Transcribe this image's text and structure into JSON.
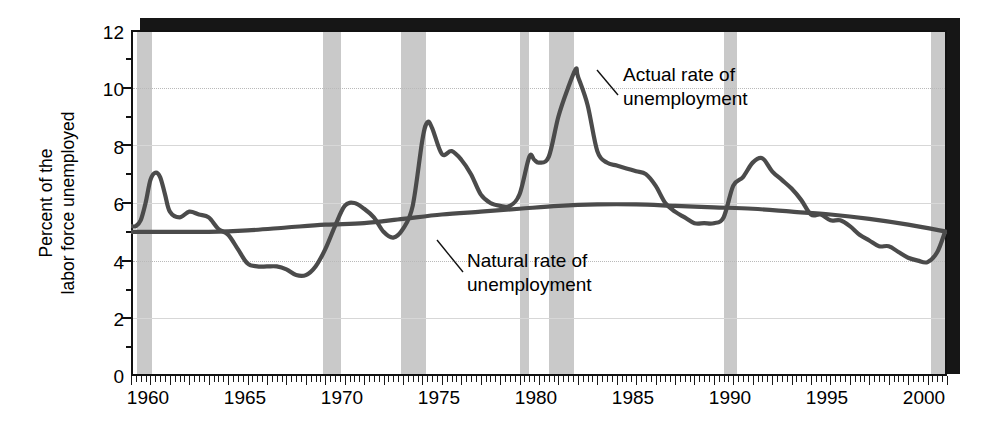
{
  "chart_data": {
    "type": "line",
    "title": "",
    "xlabel": "",
    "ylabel": "Percent of the labor force unemployed",
    "ylabel_line1": "Percent of the",
    "ylabel_line2": "labor force unemployed",
    "xlim": [
      1960,
      2002
    ],
    "ylim": [
      0,
      12
    ],
    "ytick_labels": [
      "0",
      "2",
      "4",
      "6",
      "8",
      "10",
      "12"
    ],
    "ytick_values": [
      0,
      2,
      4,
      6,
      8,
      10,
      12
    ],
    "xtick_labels": [
      "1960",
      "1965",
      "1970",
      "1975",
      "1980",
      "1985",
      "1990",
      "1995",
      "2000"
    ],
    "xtick_values": [
      1960,
      1965,
      1970,
      1975,
      1980,
      1985,
      1990,
      1995,
      2000
    ],
    "grid": "horizontal",
    "legend": "annotations",
    "line_color": "#4b4b4b",
    "recession_color": "#c9c9c9",
    "annotations": [
      {
        "name": "actual-rate-annotation",
        "line1": "Actual rate of",
        "line2": "unemployment"
      },
      {
        "name": "natural-rate-annotation",
        "line1": "Natural rate of",
        "line2": "unemployment"
      }
    ],
    "recessions": [
      {
        "start": 1960.3,
        "end": 1961.1
      },
      {
        "start": 1969.9,
        "end": 1970.8
      },
      {
        "start": 1973.9,
        "end": 1975.2
      },
      {
        "start": 1980.0,
        "end": 1980.5
      },
      {
        "start": 1981.5,
        "end": 1982.8
      },
      {
        "start": 1990.5,
        "end": 1991.2
      },
      {
        "start": 2001.2,
        "end": 2002.0
      }
    ],
    "series": [
      {
        "name": "Actual rate of unemployment",
        "x": [
          1960.0,
          1960.25,
          1960.5,
          1960.75,
          1961.0,
          1961.25,
          1961.5,
          1961.75,
          1962.0,
          1962.5,
          1963.0,
          1963.5,
          1964.0,
          1964.5,
          1965.0,
          1965.5,
          1966.0,
          1966.5,
          1967.0,
          1967.5,
          1968.0,
          1968.5,
          1969.0,
          1969.5,
          1970.0,
          1970.5,
          1971.0,
          1971.5,
          1972.0,
          1972.5,
          1973.0,
          1973.5,
          1974.0,
          1974.5,
          1975.0,
          1975.25,
          1975.5,
          1976.0,
          1976.5,
          1977.0,
          1977.5,
          1978.0,
          1978.5,
          1979.0,
          1979.5,
          1980.0,
          1980.5,
          1980.75,
          1981.0,
          1981.5,
          1982.0,
          1982.5,
          1982.9,
          1983.0,
          1983.5,
          1984.0,
          1984.5,
          1985.0,
          1985.5,
          1986.0,
          1986.5,
          1987.0,
          1987.5,
          1988.0,
          1988.5,
          1989.0,
          1989.5,
          1990.0,
          1990.5,
          1991.0,
          1991.5,
          1992.0,
          1992.5,
          1993.0,
          1993.5,
          1994.0,
          1994.5,
          1995.0,
          1995.5,
          1996.0,
          1996.5,
          1997.0,
          1997.5,
          1998.0,
          1998.5,
          1999.0,
          1999.5,
          2000.0,
          2000.5,
          2001.0,
          2001.5,
          2001.9
        ],
        "y": [
          5.2,
          5.2,
          5.4,
          6.0,
          6.8,
          7.05,
          6.9,
          6.3,
          5.7,
          5.5,
          5.7,
          5.6,
          5.5,
          5.1,
          4.9,
          4.4,
          3.9,
          3.8,
          3.8,
          3.8,
          3.7,
          3.5,
          3.5,
          3.8,
          4.4,
          5.2,
          5.9,
          6.0,
          5.8,
          5.5,
          5.0,
          4.8,
          5.1,
          5.9,
          8.2,
          8.8,
          8.6,
          7.7,
          7.8,
          7.5,
          7.0,
          6.3,
          6.0,
          5.9,
          5.9,
          6.3,
          7.6,
          7.5,
          7.4,
          7.6,
          9.0,
          10.0,
          10.65,
          10.4,
          9.4,
          7.8,
          7.4,
          7.3,
          7.2,
          7.1,
          7.0,
          6.6,
          6.0,
          5.7,
          5.5,
          5.3,
          5.3,
          5.3,
          5.5,
          6.6,
          6.9,
          7.4,
          7.55,
          7.1,
          6.8,
          6.5,
          6.1,
          5.6,
          5.6,
          5.4,
          5.4,
          5.2,
          4.9,
          4.7,
          4.5,
          4.5,
          4.3,
          4.1,
          4.0,
          3.95,
          4.3,
          5.0
        ]
      },
      {
        "name": "Natural rate of unemployment",
        "x": [
          1960,
          1962,
          1964,
          1966,
          1968,
          1970,
          1972,
          1974,
          1976,
          1978,
          1980,
          1982,
          1984,
          1986,
          1988,
          1990,
          1992,
          1994,
          1996,
          1998,
          2000,
          2002
        ],
        "y": [
          5.0,
          5.0,
          5.0,
          5.05,
          5.15,
          5.25,
          5.3,
          5.45,
          5.6,
          5.7,
          5.8,
          5.9,
          5.95,
          5.95,
          5.9,
          5.85,
          5.8,
          5.7,
          5.6,
          5.45,
          5.25,
          5.0
        ]
      }
    ]
  }
}
